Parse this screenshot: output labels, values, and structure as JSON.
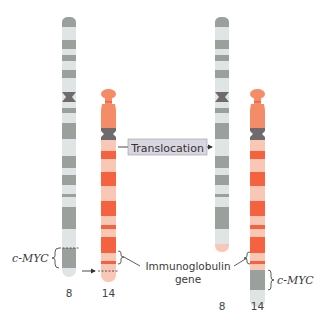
{
  "colors": {
    "gray_dark": "#9aa19d",
    "gray_light": "#dfe5e4",
    "centromere": "#6f6a6e",
    "orange_light": "#f8c7b5",
    "orange_mid": "#f58c68",
    "orange_dark": "#f4623f",
    "label_box": "#d9d6e0"
  },
  "labels": {
    "translocation": "Translocation",
    "cmyc_left": "c-MYC",
    "cmyc_right": "c-MYC",
    "immunoglobulin_line1": "Immunoglobulin",
    "immunoglobulin_line2": "gene"
  },
  "chromosomes": {
    "before": [
      {
        "id": "chr8",
        "number": "8"
      },
      {
        "id": "chr14",
        "number": "14"
      }
    ],
    "after": [
      {
        "id": "der8",
        "number": "8"
      },
      {
        "id": "der14",
        "number": "14"
      }
    ]
  }
}
